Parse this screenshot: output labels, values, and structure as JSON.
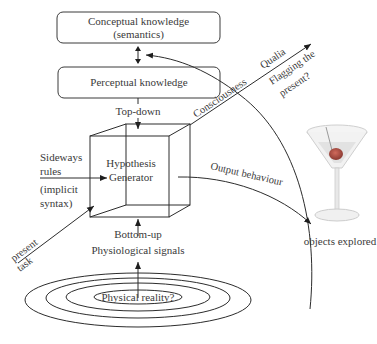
{
  "diagram": {
    "boxes": {
      "conceptual": {
        "line1": "Conceptual knowledge",
        "line2": "(semantics)"
      },
      "perceptual": {
        "label": "Perceptual knowledge"
      }
    },
    "labels": {
      "top_down": "Top-down",
      "hypothesis_line1": "Hypothesis",
      "hypothesis_line2": "Generator",
      "sideways_line1": "Sideways",
      "sideways_line2": "rules",
      "implicit_line1": "(implicit",
      "implicit_line2": "syntax)",
      "consciousness": "Consciousness",
      "qualia": "Qualia",
      "flagging_line1": "Flagging the",
      "flagging_line2": "present?",
      "output_behaviour": "Output behaviour",
      "objects_explored": "objects explored",
      "present": "present",
      "task": "task",
      "bottom_up": "Bottom-up",
      "physiological_signals": "Physiological signals",
      "physical_reality": "Physical reality?"
    },
    "colors": {
      "line": "#2c2c2c",
      "text": "#3a3a3a",
      "olive": "#b0443c",
      "glass": "#d8d8d8"
    }
  }
}
